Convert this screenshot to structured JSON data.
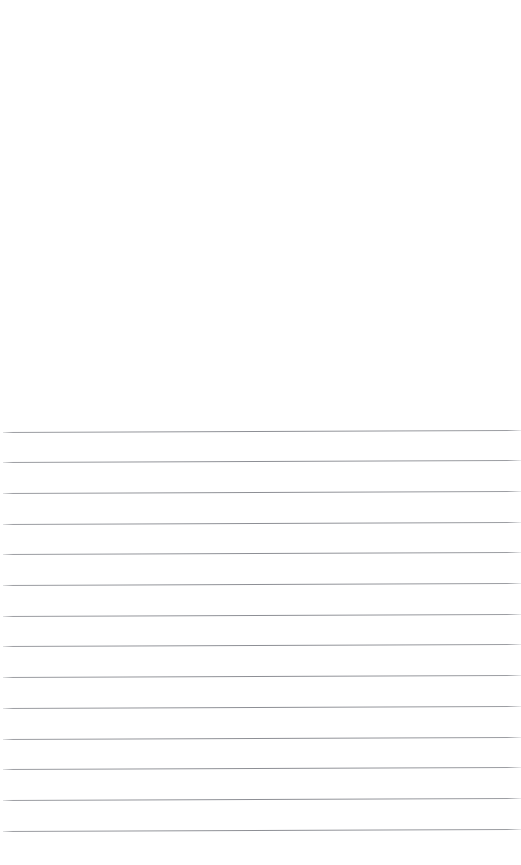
{
  "page": {
    "kind": "lined-notepad-page",
    "width": 521,
    "height": 865,
    "background_color": "#ffffff",
    "text_content": "",
    "note": ""
  },
  "blank_region": {
    "label": "",
    "top": 0,
    "height": 430
  },
  "rules": {
    "label": "",
    "count": 14,
    "color": "#8c8e94",
    "thickness_px": 1,
    "spacing_px": 30.7,
    "first_line_y": 431,
    "last_line_y": 830,
    "left_x": 3,
    "right_x": 521,
    "skew_deg": -0.22,
    "lines": [
      {
        "y": 431.5,
        "text": ""
      },
      {
        "y": 462.2,
        "text": ""
      },
      {
        "y": 492.9,
        "text": ""
      },
      {
        "y": 523.6,
        "text": ""
      },
      {
        "y": 554.3,
        "text": ""
      },
      {
        "y": 585.0,
        "text": ""
      },
      {
        "y": 615.7,
        "text": ""
      },
      {
        "y": 646.4,
        "text": ""
      },
      {
        "y": 677.1,
        "text": ""
      },
      {
        "y": 707.8,
        "text": ""
      },
      {
        "y": 738.5,
        "text": ""
      },
      {
        "y": 769.2,
        "text": ""
      },
      {
        "y": 799.9,
        "text": ""
      },
      {
        "y": 830.6,
        "text": ""
      }
    ]
  }
}
